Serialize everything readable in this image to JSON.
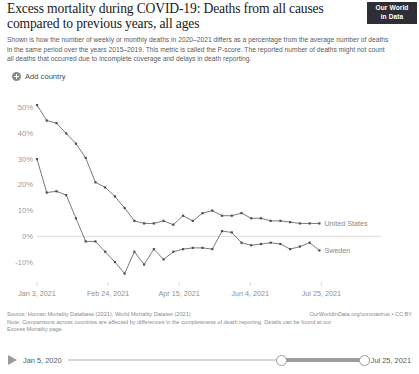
{
  "header": {
    "title": "Excess mortality during COVID-19: Deaths from all causes compared to previous years, all ages",
    "subtitle": "Shown is how the number of weekly or monthly deaths in 2020–2021 differs as a percentage from the average number of deaths in the same period over the years 2015–2019. This metric is called the P-score. The reported number of deaths might not count all deaths that occurred due to incomplete coverage and delays in death reporting.",
    "logo_line1": "Our World",
    "logo_line2": "in Data"
  },
  "controls": {
    "add_country_label": "Add country",
    "add_country_icon": "plus-circle-icon"
  },
  "chart_data": {
    "type": "line",
    "title": "Excess mortality during COVID-19: Deaths from all causes compared to previous years, all ages",
    "xlabel": "",
    "ylabel": "",
    "ylim": [
      -17,
      53
    ],
    "yticks": [
      -10,
      0,
      10,
      20,
      30,
      40,
      50
    ],
    "ytick_labels": [
      "-10%",
      "0%",
      "10%",
      "20%",
      "30%",
      "40%",
      "50%"
    ],
    "grid": false,
    "zero_line": true,
    "legend_position": "right-inline",
    "xtick_labels": [
      "Jan 3, 2021",
      "Feb 24, 2021",
      "Apr 15, 2021",
      "Jun 4, 2021",
      "Jul 25, 2021"
    ],
    "xtick_values": [
      0,
      7.3,
      14.6,
      21.9,
      29.2
    ],
    "xlim": [
      0,
      30.5
    ],
    "series": [
      {
        "name": "United States",
        "color": "#6b6b6b",
        "x": [
          0,
          1,
          2,
          3,
          4,
          5,
          6,
          7,
          8,
          9,
          10,
          11,
          12,
          13,
          14,
          15,
          16,
          17,
          18,
          19,
          20,
          21,
          22,
          23,
          24,
          25,
          26,
          27,
          28,
          29
        ],
        "values": [
          51,
          45,
          44,
          40,
          36,
          30.5,
          21,
          19,
          15.5,
          11,
          6,
          5,
          5,
          6,
          4.5,
          8,
          6,
          9,
          10,
          8,
          8,
          9,
          7,
          7,
          6,
          6,
          5.5,
          5,
          5,
          5
        ]
      },
      {
        "name": "Sweden",
        "color": "#6b6b6b",
        "x": [
          0,
          1,
          2,
          3,
          4,
          5,
          6,
          7,
          8,
          9,
          10,
          11,
          12,
          13,
          14,
          15,
          16,
          17,
          18,
          19,
          20,
          21,
          22,
          23,
          24,
          25,
          26,
          27,
          28,
          29
        ],
        "values": [
          30,
          17,
          17.5,
          16,
          7,
          -2,
          -2,
          -6,
          -10,
          -14.5,
          -6,
          -11,
          -5,
          -9,
          -6,
          -5,
          -4.5,
          -4.5,
          -5,
          2,
          1.5,
          -2.5,
          -3.5,
          -3,
          -2.5,
          -3,
          -5,
          -4,
          -2.5,
          -5.5
        ]
      }
    ]
  },
  "footer": {
    "source": "Source: Human Mortality Database (2021), World Mortality Dataset (2021)",
    "attribution": "OurWorldInData.org/coronavirus • CC BY",
    "note": "Note: Comparisons across countries are affected by differences in the completeness of death reporting. Details can be found at our Excess Mortality page."
  },
  "timeline": {
    "play_icon": "play-triangle-icon",
    "start_label": "Jan 5, 2020",
    "end_label": "Jul 25, 2021",
    "selected_start": "Jan 3, 2021",
    "selected_end": "Jul 25, 2021"
  }
}
